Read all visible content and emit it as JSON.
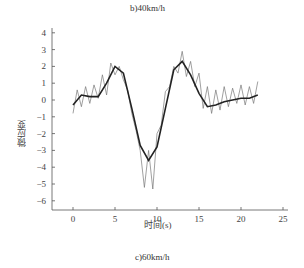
{
  "captions": {
    "top": "b)40km/h",
    "bottom": "c)60km/h"
  },
  "chart_data": {
    "type": "line",
    "title": "c)60km/h",
    "xlabel": "时间(s)",
    "ylabel": "微应变",
    "xlim": [
      -2.5,
      25
    ],
    "ylim": [
      -6.5,
      4.2
    ],
    "xticks": [
      0,
      5,
      10,
      15,
      20,
      25
    ],
    "yticks": [
      4,
      3,
      2,
      1,
      0,
      -1,
      -2,
      -3,
      -4,
      -5,
      -6
    ],
    "grid": false,
    "legend": null,
    "series": [
      {
        "name": "measured (noisy)",
        "style": "thin gray oscillating line",
        "x": [
          0,
          0.5,
          1,
          1.5,
          2,
          2.5,
          3,
          3.5,
          4,
          4.5,
          5,
          5.5,
          6,
          6.5,
          7,
          7.5,
          8,
          8.5,
          9,
          9.5,
          10,
          10.5,
          11,
          11.5,
          12,
          12.5,
          13,
          13.5,
          14,
          14.5,
          15,
          15.5,
          16,
          16.5,
          17,
          17.5,
          18,
          18.5,
          19,
          19.5,
          20,
          20.5,
          21,
          21.5,
          22
        ],
        "values": [
          -0.8,
          0.6,
          -0.4,
          0.8,
          -0.2,
          0.9,
          0.1,
          1.5,
          0.3,
          2.2,
          1.5,
          2.0,
          1.2,
          0.6,
          -0.8,
          -1.8,
          -3.0,
          -5.2,
          -3.0,
          -5.3,
          -2.0,
          -1.5,
          0.5,
          0.8,
          2.0,
          1.6,
          2.9,
          1.4,
          2.3,
          0.8,
          1.6,
          -0.5,
          0.8,
          -0.8,
          0.6,
          -0.6,
          0.8,
          -0.4,
          0.7,
          -0.2,
          0.9,
          -0.3,
          0.8,
          -0.2,
          1.1
        ]
      },
      {
        "name": "fitted (smooth)",
        "style": "thick dark line",
        "x": [
          0,
          1,
          2,
          3,
          4,
          5,
          6,
          7,
          8,
          9,
          10,
          11,
          12,
          13,
          14,
          15,
          16,
          17,
          18,
          19,
          20,
          21,
          22
        ],
        "values": [
          -0.3,
          0.3,
          0.2,
          0.2,
          1.0,
          2.0,
          1.6,
          -0.5,
          -2.7,
          -3.6,
          -2.8,
          -0.5,
          1.8,
          2.3,
          1.5,
          0.4,
          -0.4,
          -0.3,
          -0.1,
          0.0,
          0.1,
          0.1,
          0.3
        ]
      }
    ]
  }
}
